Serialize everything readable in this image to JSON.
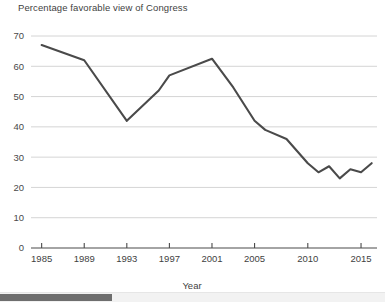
{
  "chart_data": {
    "type": "line",
    "title": "Percentage favorable view of Congress",
    "xlabel": "Year",
    "ylabel": "",
    "xlim": [
      1984,
      2016.5
    ],
    "ylim": [
      0,
      70
    ],
    "grid": true,
    "legend": "none",
    "xticks": [
      "1985",
      "1989",
      "1993",
      "1997",
      "2001",
      "2005",
      "2010",
      "2015"
    ],
    "xtick_values": [
      1985,
      1989,
      1993,
      1997,
      2001,
      2005,
      2010,
      2015
    ],
    "yticks": [
      "0",
      "10",
      "20",
      "30",
      "40",
      "50",
      "60",
      "70"
    ],
    "ytick_values": [
      0,
      10,
      20,
      30,
      40,
      50,
      60,
      70
    ],
    "series": [
      {
        "name": "Percentage favorable view of Congress",
        "color": "#4a4a4a",
        "x": [
          1985,
          1989,
          1993,
          1996,
          1997,
          2001,
          2003,
          2005,
          2006,
          2008,
          2010,
          2011,
          2012,
          2013,
          2014,
          2015,
          2016
        ],
        "values": [
          67,
          62,
          42,
          52,
          57,
          62.5,
          53,
          42,
          39,
          36,
          28,
          25,
          27,
          23,
          26,
          25,
          28
        ]
      }
    ]
  },
  "scrollbar": {
    "name": "horizontal-scrollbar"
  }
}
